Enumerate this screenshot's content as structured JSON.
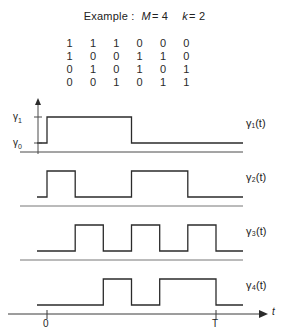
{
  "title": {
    "prefix": "Example :",
    "param1_name": "M",
    "param1_eq": "= 4",
    "param2_name": "k",
    "param2_eq": "= 2"
  },
  "matrix": {
    "rows": [
      [
        "1",
        "1",
        "1",
        "0",
        "0",
        "0"
      ],
      [
        "1",
        "0",
        "0",
        "1",
        "1",
        "0"
      ],
      [
        "0",
        "1",
        "0",
        "1",
        "0",
        "1"
      ],
      [
        "0",
        "0",
        "1",
        "0",
        "1",
        "1"
      ]
    ]
  },
  "axis": {
    "y_high_label": "γ",
    "y_high_sub": "1",
    "y_low_label": "γ",
    "y_low_sub": "0",
    "t_origin_label": "0",
    "t_end_label": "T",
    "t_axis_label": "t"
  },
  "waveforms": [
    {
      "name": "γ",
      "sub": "1",
      "arg": "(t)",
      "label": "γ₁(t)",
      "bits": [
        1,
        1,
        1,
        0,
        0,
        0
      ]
    },
    {
      "name": "γ",
      "sub": "2",
      "arg": "(t)",
      "label": "γ₂(t)",
      "bits": [
        1,
        0,
        0,
        1,
        1,
        0
      ]
    },
    {
      "name": "γ",
      "sub": "3",
      "arg": "(t)",
      "label": "γ₃(t)",
      "bits": [
        0,
        1,
        0,
        1,
        0,
        1
      ]
    },
    {
      "name": "γ",
      "sub": "4",
      "arg": "(t)",
      "label": "γ₄(t)",
      "bits": [
        0,
        0,
        1,
        0,
        1,
        1
      ]
    }
  ],
  "chart_data": {
    "type": "line",
    "xlabel": "t",
    "ylabel": "",
    "x_ticks": [
      "0",
      "T"
    ],
    "xlim": [
      0,
      6
    ],
    "y_levels": {
      "low": "γ₀",
      "high": "γ₁"
    },
    "n_slots": 6,
    "series": [
      {
        "name": "γ₁(t)",
        "values": [
          1,
          1,
          1,
          0,
          0,
          0
        ]
      },
      {
        "name": "γ₂(t)",
        "values": [
          1,
          0,
          0,
          1,
          1,
          0
        ]
      },
      {
        "name": "γ₃(t)",
        "values": [
          0,
          1,
          0,
          1,
          0,
          1
        ]
      },
      {
        "name": "γ₄(t)",
        "values": [
          0,
          0,
          1,
          0,
          1,
          1
        ]
      }
    ],
    "grid": false,
    "legend": "right"
  },
  "geometry": {
    "x0": 47,
    "xT": 216,
    "plot_tops": [
      0,
      56,
      110,
      164
    ],
    "plot_height": 56,
    "low_y": 47,
    "high_y": 21
  }
}
